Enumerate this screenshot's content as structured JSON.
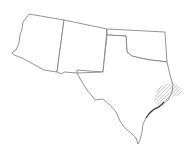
{
  "map": {
    "type": "species-range-map",
    "region": "South-central / Southwestern United States",
    "states": [
      "Arizona",
      "New Mexico",
      "Oklahoma",
      "Texas"
    ],
    "range_style": "diagonal hatching",
    "range_location": "Upper Texas Gulf Coast into western Louisiana border",
    "colors": {
      "outline": "#7a7a7a",
      "hatch": "#8a8a8a",
      "background": "#ffffff"
    }
  }
}
